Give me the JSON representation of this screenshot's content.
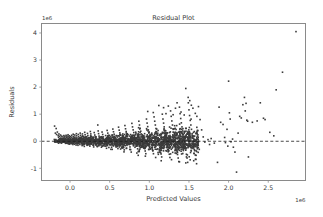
{
  "figure": {
    "background_color": "#ffffff",
    "axes_background_color": "#ffffff",
    "spine_color": "#8a8a8a",
    "point_color": "#3b3b3b",
    "zero_line_color": "#1a1a1a"
  },
  "chart_data": {
    "type": "scatter",
    "title": "Residual Plot",
    "xlabel": "Predicted Values",
    "ylabel": "Residuals",
    "x_offset_text": "1e6",
    "y_offset_text": "1e6",
    "grid": false,
    "legend": false,
    "xlim": [
      -0.36,
      2.97
    ],
    "ylim": [
      -1.45,
      4.35
    ],
    "x_scale_factor": 1000000,
    "y_scale_factor": 1000000,
    "xticks": [
      0.0,
      0.5,
      1.0,
      1.5,
      2.0,
      2.5
    ],
    "xtick_labels": [
      "0.0",
      "0.5",
      "1.0",
      "1.5",
      "2.0",
      "2.5"
    ],
    "yticks": [
      -1,
      0,
      1,
      2,
      3,
      4
    ],
    "ytick_labels": [
      "-1",
      "0",
      "1",
      "2",
      "3",
      "4"
    ],
    "reference_line": {
      "type": "horizontal-dashed",
      "y": 0
    },
    "marker": {
      "shape": "square",
      "size_px": 1.6
    },
    "points": [
      [
        -0.195,
        0.56
      ],
      [
        -0.185,
        0.3
      ],
      [
        -0.175,
        0.47
      ],
      [
        -0.17,
        0.25
      ],
      [
        -0.16,
        0.34
      ],
      [
        -0.15,
        0.21
      ],
      [
        -0.145,
        0.15
      ],
      [
        -0.14,
        0.27
      ],
      [
        -0.13,
        0.18
      ],
      [
        -0.125,
        0.09
      ],
      [
        -0.12,
        0.23
      ],
      [
        -0.115,
        0.12
      ],
      [
        -0.11,
        0.05
      ],
      [
        -0.105,
        0.19
      ],
      [
        -0.1,
        0.1
      ],
      [
        -0.095,
        0.02
      ],
      [
        -0.09,
        0.16
      ],
      [
        -0.085,
        0.08
      ],
      [
        -0.08,
        -0.02
      ],
      [
        -0.078,
        0.21
      ],
      [
        -0.075,
        0.13
      ],
      [
        -0.07,
        0.05
      ],
      [
        -0.068,
        -0.04
      ],
      [
        -0.065,
        0.18
      ],
      [
        -0.06,
        0.1
      ],
      [
        -0.058,
        0.03
      ],
      [
        -0.055,
        -0.05
      ],
      [
        -0.05,
        0.22
      ],
      [
        -0.048,
        0.15
      ],
      [
        -0.045,
        0.08
      ],
      [
        -0.042,
        0.01
      ],
      [
        -0.04,
        -0.06
      ],
      [
        -0.038,
        0.19
      ],
      [
        -0.035,
        0.12
      ],
      [
        -0.032,
        0.05
      ],
      [
        -0.03,
        -0.02
      ],
      [
        -0.028,
        -0.08
      ],
      [
        -0.025,
        0.24
      ],
      [
        -0.022,
        0.16
      ],
      [
        -0.02,
        0.09
      ],
      [
        -0.018,
        0.03
      ],
      [
        -0.015,
        -0.04
      ],
      [
        -0.012,
        -0.1
      ],
      [
        -0.01,
        0.2
      ],
      [
        -0.008,
        0.13
      ],
      [
        -0.005,
        0.06
      ],
      [
        -0.002,
        -0.01
      ],
      [
        0.0,
        -0.07
      ],
      [
        0.003,
        0.17
      ],
      [
        0.006,
        0.11
      ],
      [
        0.01,
        0.04
      ],
      [
        0.013,
        -0.03
      ],
      [
        0.016,
        -0.09
      ],
      [
        0.02,
        0.22
      ],
      [
        0.023,
        0.15
      ],
      [
        0.026,
        0.08
      ],
      [
        0.03,
        0.01
      ],
      [
        0.033,
        -0.06
      ],
      [
        0.036,
        -0.12
      ],
      [
        0.04,
        0.26
      ],
      [
        0.043,
        0.18
      ],
      [
        0.046,
        0.1
      ],
      [
        0.05,
        0.03
      ],
      [
        0.053,
        -0.04
      ],
      [
        0.056,
        -0.11
      ],
      [
        0.06,
        0.23
      ],
      [
        0.063,
        0.15
      ],
      [
        0.066,
        0.07
      ],
      [
        0.07,
        0.0
      ],
      [
        0.073,
        -0.07
      ],
      [
        0.076,
        -0.14
      ],
      [
        0.08,
        0.28
      ],
      [
        0.083,
        0.2
      ],
      [
        0.086,
        0.12
      ],
      [
        0.09,
        0.05
      ],
      [
        0.093,
        -0.02
      ],
      [
        0.096,
        -0.09
      ],
      [
        0.1,
        -0.15
      ],
      [
        0.104,
        0.25
      ],
      [
        0.108,
        0.17
      ],
      [
        0.112,
        0.09
      ],
      [
        0.116,
        0.02
      ],
      [
        0.12,
        -0.05
      ],
      [
        0.124,
        -0.12
      ],
      [
        0.128,
        0.3
      ],
      [
        0.132,
        0.22
      ],
      [
        0.136,
        0.14
      ],
      [
        0.14,
        0.06
      ],
      [
        0.144,
        -0.01
      ],
      [
        0.148,
        -0.08
      ],
      [
        0.152,
        -0.16
      ],
      [
        0.156,
        0.27
      ],
      [
        0.16,
        0.19
      ],
      [
        0.164,
        0.11
      ],
      [
        0.168,
        0.03
      ],
      [
        0.172,
        -0.04
      ],
      [
        0.176,
        -0.12
      ],
      [
        0.18,
        -0.19
      ],
      [
        0.185,
        0.33
      ],
      [
        0.19,
        0.24
      ],
      [
        0.195,
        0.16
      ],
      [
        0.2,
        0.08
      ],
      [
        0.205,
        0.0
      ],
      [
        0.21,
        -0.07
      ],
      [
        0.215,
        -0.15
      ],
      [
        0.22,
        0.29
      ],
      [
        0.225,
        0.21
      ],
      [
        0.23,
        0.13
      ],
      [
        0.235,
        0.05
      ],
      [
        0.24,
        -0.03
      ],
      [
        0.245,
        -0.1
      ],
      [
        0.25,
        -0.18
      ],
      [
        0.256,
        0.36
      ],
      [
        0.262,
        0.27
      ],
      [
        0.268,
        0.18
      ],
      [
        0.274,
        0.1
      ],
      [
        0.28,
        0.02
      ],
      [
        0.286,
        -0.06
      ],
      [
        0.292,
        -0.14
      ],
      [
        0.298,
        -0.21
      ],
      [
        0.305,
        0.32
      ],
      [
        0.312,
        0.23
      ],
      [
        0.318,
        0.15
      ],
      [
        0.324,
        0.06
      ],
      [
        0.33,
        -0.02
      ],
      [
        0.336,
        -0.1
      ],
      [
        0.342,
        -0.18
      ],
      [
        0.35,
        0.6
      ],
      [
        0.355,
        0.38
      ],
      [
        0.36,
        0.28
      ],
      [
        0.366,
        0.19
      ],
      [
        0.372,
        0.11
      ],
      [
        0.378,
        0.02
      ],
      [
        0.384,
        -0.06
      ],
      [
        0.39,
        -0.14
      ],
      [
        0.396,
        -0.22
      ],
      [
        0.404,
        0.34
      ],
      [
        0.412,
        0.25
      ],
      [
        0.42,
        0.16
      ],
      [
        0.428,
        0.07
      ],
      [
        0.436,
        -0.01
      ],
      [
        0.444,
        -0.09
      ],
      [
        0.452,
        -0.18
      ],
      [
        0.46,
        -0.26
      ],
      [
        0.468,
        0.4
      ],
      [
        0.476,
        0.3
      ],
      [
        0.484,
        0.21
      ],
      [
        0.492,
        0.12
      ],
      [
        0.5,
        0.03
      ],
      [
        0.508,
        -0.05
      ],
      [
        0.516,
        -0.14
      ],
      [
        0.524,
        -0.22
      ],
      [
        0.532,
        -0.3
      ],
      [
        0.54,
        0.45
      ],
      [
        0.548,
        0.35
      ],
      [
        0.556,
        0.26
      ],
      [
        0.564,
        0.17
      ],
      [
        0.572,
        0.08
      ],
      [
        0.58,
        -0.01
      ],
      [
        0.588,
        -0.1
      ],
      [
        0.596,
        -0.19
      ],
      [
        0.604,
        -0.27
      ],
      [
        0.612,
        0.52
      ],
      [
        0.62,
        0.41
      ],
      [
        0.628,
        0.31
      ],
      [
        0.636,
        0.22
      ],
      [
        0.644,
        0.13
      ],
      [
        0.652,
        0.04
      ],
      [
        0.66,
        -0.05
      ],
      [
        0.668,
        -0.14
      ],
      [
        0.676,
        -0.23
      ],
      [
        0.684,
        -0.32
      ],
      [
        0.692,
        0.58
      ],
      [
        0.7,
        0.46
      ],
      [
        0.708,
        0.36
      ],
      [
        0.716,
        0.26
      ],
      [
        0.724,
        0.17
      ],
      [
        0.732,
        0.07
      ],
      [
        0.74,
        -0.02
      ],
      [
        0.748,
        -0.12
      ],
      [
        0.756,
        -0.21
      ],
      [
        0.764,
        -0.31
      ],
      [
        0.772,
        -0.4
      ],
      [
        0.78,
        0.66
      ],
      [
        0.788,
        0.53
      ],
      [
        0.796,
        0.42
      ],
      [
        0.804,
        0.32
      ],
      [
        0.812,
        0.22
      ],
      [
        0.82,
        0.12
      ],
      [
        0.828,
        0.02
      ],
      [
        0.836,
        -0.08
      ],
      [
        0.844,
        -0.18
      ],
      [
        0.852,
        -0.28
      ],
      [
        0.86,
        -0.38
      ],
      [
        0.868,
        0.74
      ],
      [
        0.876,
        0.6
      ],
      [
        0.884,
        0.48
      ],
      [
        0.892,
        0.37
      ],
      [
        0.9,
        0.27
      ],
      [
        0.908,
        0.16
      ],
      [
        0.916,
        0.06
      ],
      [
        0.924,
        -0.05
      ],
      [
        0.932,
        -0.15
      ],
      [
        0.94,
        -0.25
      ],
      [
        0.948,
        -0.36
      ],
      [
        0.956,
        -0.46
      ],
      [
        0.964,
        0.82
      ],
      [
        0.972,
        0.67
      ],
      [
        0.98,
        0.54
      ],
      [
        0.988,
        0.42
      ],
      [
        0.996,
        0.31
      ],
      [
        1.004,
        0.2
      ],
      [
        1.012,
        0.09
      ],
      [
        1.02,
        -0.02
      ],
      [
        1.028,
        -0.13
      ],
      [
        1.036,
        -0.24
      ],
      [
        1.044,
        -0.35
      ],
      [
        1.052,
        -0.46
      ],
      [
        1.06,
        0.9
      ],
      [
        1.068,
        0.74
      ],
      [
        1.076,
        0.6
      ],
      [
        1.084,
        0.47
      ],
      [
        1.092,
        0.35
      ],
      [
        1.1,
        0.23
      ],
      [
        1.108,
        0.12
      ],
      [
        1.116,
        0.0
      ],
      [
        1.124,
        -0.11
      ],
      [
        1.132,
        -0.23
      ],
      [
        1.14,
        -0.35
      ],
      [
        1.148,
        -0.47
      ],
      [
        1.156,
        -0.58
      ],
      [
        1.164,
        1.0
      ],
      [
        1.172,
        0.82
      ],
      [
        1.18,
        0.67
      ],
      [
        1.188,
        0.53
      ],
      [
        1.196,
        0.4
      ],
      [
        1.204,
        0.27
      ],
      [
        1.212,
        0.15
      ],
      [
        1.22,
        0.03
      ],
      [
        1.228,
        -0.1
      ],
      [
        1.236,
        -0.22
      ],
      [
        1.244,
        -0.35
      ],
      [
        1.252,
        -0.48
      ],
      [
        1.26,
        -0.6
      ],
      [
        1.268,
        1.12
      ],
      [
        1.276,
        0.92
      ],
      [
        1.284,
        0.75
      ],
      [
        1.292,
        0.6
      ],
      [
        1.3,
        0.46
      ],
      [
        1.308,
        0.32
      ],
      [
        1.316,
        0.19
      ],
      [
        1.324,
        0.06
      ],
      [
        1.332,
        -0.08
      ],
      [
        1.34,
        -0.21
      ],
      [
        1.348,
        -0.35
      ],
      [
        1.356,
        -0.49
      ],
      [
        1.364,
        -0.62
      ],
      [
        1.372,
        -0.75
      ],
      [
        1.38,
        1.26
      ],
      [
        1.388,
        1.02
      ],
      [
        1.396,
        0.84
      ],
      [
        1.404,
        0.68
      ],
      [
        1.412,
        0.53
      ],
      [
        1.42,
        0.38
      ],
      [
        1.428,
        0.24
      ],
      [
        1.436,
        0.1
      ],
      [
        1.444,
        -0.04
      ],
      [
        1.452,
        -0.19
      ],
      [
        1.46,
        -0.33
      ],
      [
        1.468,
        -0.48
      ],
      [
        1.476,
        -0.62
      ],
      [
        1.484,
        -0.78
      ],
      [
        1.492,
        1.42
      ],
      [
        1.5,
        1.16
      ],
      [
        1.508,
        0.95
      ],
      [
        1.516,
        0.77
      ],
      [
        1.524,
        0.6
      ],
      [
        1.532,
        0.44
      ],
      [
        1.54,
        0.28
      ],
      [
        1.548,
        0.13
      ],
      [
        1.556,
        -0.03
      ],
      [
        1.564,
        -0.19
      ],
      [
        1.572,
        -0.35
      ],
      [
        1.58,
        -0.51
      ],
      [
        1.588,
        -0.67
      ],
      [
        1.596,
        -0.83
      ],
      [
        1.46,
        1.95
      ],
      [
        1.49,
        1.62
      ],
      [
        1.51,
        1.5
      ],
      [
        1.53,
        1.33
      ],
      [
        1.55,
        1.22
      ],
      [
        1.35,
        1.42
      ],
      [
        1.33,
        1.22
      ],
      [
        1.24,
        1.3
      ],
      [
        1.18,
        1.24
      ],
      [
        1.12,
        1.32
      ],
      [
        1.05,
        1.06
      ],
      [
        0.98,
        1.1
      ],
      [
        1.4,
        1.08
      ],
      [
        1.44,
        0.97
      ],
      [
        1.3,
        0.98
      ],
      [
        1.21,
        1.02
      ],
      [
        1.58,
        1.03
      ],
      [
        1.6,
        0.92
      ],
      [
        1.62,
        1.28
      ],
      [
        1.64,
        0.8
      ],
      [
        1.66,
        0.42
      ],
      [
        1.68,
        0.16
      ],
      [
        1.7,
        -0.03
      ],
      [
        1.63,
        -0.3
      ],
      [
        1.59,
        -0.52
      ],
      [
        1.56,
        -0.72
      ],
      [
        1.46,
        -0.8
      ],
      [
        1.38,
        -0.76
      ],
      [
        1.28,
        -0.68
      ],
      [
        1.15,
        -0.72
      ],
      [
        1.08,
        -0.6
      ],
      [
        0.95,
        -0.55
      ],
      [
        0.86,
        -0.52
      ],
      [
        1.74,
        0.06
      ],
      [
        1.76,
        -0.12
      ],
      [
        1.78,
        0.1
      ],
      [
        1.82,
        -0.07
      ],
      [
        1.86,
        -0.78
      ],
      [
        1.88,
        1.26
      ],
      [
        1.9,
        0.7
      ],
      [
        1.93,
        0.62
      ],
      [
        1.95,
        0.14
      ],
      [
        1.96,
        -0.05
      ],
      [
        1.98,
        0.44
      ],
      [
        1.99,
        -0.18
      ],
      [
        2.0,
        2.22
      ],
      [
        2.01,
        1.05
      ],
      [
        2.02,
        0.82
      ],
      [
        2.03,
        -0.02
      ],
      [
        2.05,
        0.08
      ],
      [
        2.06,
        -0.22
      ],
      [
        2.08,
        -0.4
      ],
      [
        2.1,
        -1.14
      ],
      [
        2.12,
        0.3
      ],
      [
        2.14,
        0.92
      ],
      [
        2.16,
        0.86
      ],
      [
        2.18,
        1.35
      ],
      [
        2.2,
        1.62
      ],
      [
        2.21,
        1.12
      ],
      [
        2.22,
        1.4
      ],
      [
        2.23,
        0.78
      ],
      [
        2.24,
        0.74
      ],
      [
        2.25,
        -0.58
      ],
      [
        2.3,
        0.7
      ],
      [
        2.36,
        0.75
      ],
      [
        2.4,
        1.42
      ],
      [
        2.44,
        0.85
      ],
      [
        2.46,
        0.8
      ],
      [
        2.52,
        0.33
      ],
      [
        2.57,
        0.2
      ],
      [
        2.6,
        1.9
      ],
      [
        2.68,
        2.55
      ],
      [
        2.85,
        4.05
      ]
    ]
  }
}
